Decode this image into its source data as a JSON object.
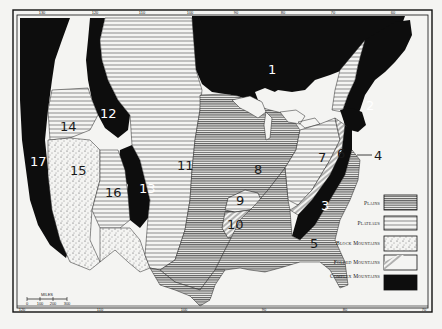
{
  "map": {
    "title": "",
    "frame_color": "#111111",
    "background": "#f4f4f2",
    "regions": [
      {
        "id": "1",
        "label": "1",
        "type": "complex_mountains"
      },
      {
        "id": "2",
        "label": "2",
        "type": "complex_mountains"
      },
      {
        "id": "3",
        "label": "3",
        "type": "complex_mountains"
      },
      {
        "id": "4",
        "label": "4",
        "type": "plains"
      },
      {
        "id": "5",
        "label": "5",
        "type": "plains"
      },
      {
        "id": "6",
        "label": "6",
        "type": "folded_mountains"
      },
      {
        "id": "7",
        "label": "7",
        "type": "plateaus"
      },
      {
        "id": "8",
        "label": "8",
        "type": "plains"
      },
      {
        "id": "9",
        "label": "9",
        "type": "plateaus"
      },
      {
        "id": "10",
        "label": "10",
        "type": "folded_mountains"
      },
      {
        "id": "11",
        "label": "11",
        "type": "plateaus"
      },
      {
        "id": "12",
        "label": "12",
        "type": "complex_mountains"
      },
      {
        "id": "13",
        "label": "13",
        "type": "complex_mountains"
      },
      {
        "id": "14",
        "label": "14",
        "type": "plateaus"
      },
      {
        "id": "15",
        "label": "15",
        "type": "block_mountains"
      },
      {
        "id": "16",
        "label": "16",
        "type": "plateaus"
      },
      {
        "id": "17",
        "label": "17",
        "type": "complex_mountains"
      }
    ],
    "legend": {
      "items": [
        {
          "key": "plains",
          "label": "Plains",
          "pattern": "dense-horizontal-lines"
        },
        {
          "key": "plateaus",
          "label": "Plateaus",
          "pattern": "sparse-horizontal-lines"
        },
        {
          "key": "block_mountains",
          "label": "Block Mountains",
          "pattern": "dots"
        },
        {
          "key": "folded_mountains",
          "label": "Folded Mountains",
          "pattern": "diagonal-lines"
        },
        {
          "key": "complex_mountains",
          "label": "Complex Mountains",
          "pattern": "solid-black"
        }
      ]
    },
    "scale_bar": {
      "label": "MILES",
      "ticks": [
        "0",
        "100",
        "200",
        "300"
      ]
    },
    "top_longitudes": [
      "130",
      "120",
      "110",
      "100",
      "90",
      "80",
      "70",
      "60"
    ],
    "bottom_longitudes": [
      "120",
      "110",
      "100",
      "90",
      "80",
      "70"
    ]
  }
}
